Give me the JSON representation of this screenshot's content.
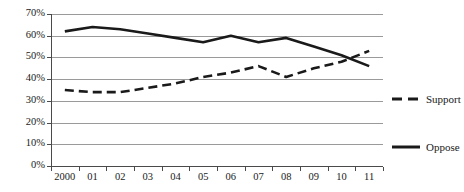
{
  "chart_data": {
    "type": "line",
    "title": "",
    "subtitle": "",
    "xlabel": "",
    "ylabel": "",
    "grid": true,
    "legend_position": "right",
    "ylim": [
      0,
      70
    ],
    "ytick_labels": [
      "0%",
      "10%",
      "20%",
      "30%",
      "40%",
      "50%",
      "60%",
      "70%"
    ],
    "ytick_values": [
      0,
      10,
      20,
      30,
      40,
      50,
      60,
      70
    ],
    "categories": [
      "2000",
      "01",
      "02",
      "03",
      "04",
      "05",
      "06",
      "07",
      "08",
      "09",
      "10",
      "11"
    ],
    "series": [
      {
        "name": "Oppose",
        "style": "solid",
        "color": "#1a1a1a",
        "values": [
          62,
          64,
          63,
          61,
          59,
          57,
          60,
          57,
          59,
          55,
          51,
          46
        ]
      },
      {
        "name": "Support",
        "style": "dashed",
        "color": "#1a1a1a",
        "values": [
          35,
          34,
          34,
          36,
          38,
          41,
          43,
          46,
          41,
          45,
          48,
          53
        ]
      }
    ]
  },
  "legend": {
    "entries": [
      {
        "label": "Support",
        "style": "dashed"
      },
      {
        "label": "Oppose",
        "style": "solid"
      }
    ]
  }
}
